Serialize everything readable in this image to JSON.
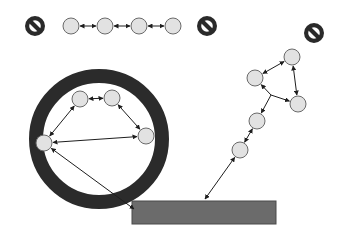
{
  "diagram": {
    "type": "network-topology",
    "colors": {
      "background": "#ffffff",
      "node_fill": "#e2e2e2",
      "node_stroke": "#6a6a6a",
      "edge": "#1e1e1e",
      "ring": "#2b2b2b",
      "bar_fill": "#6b6b6b",
      "prohibited_icon": "#2a2a2a"
    },
    "prohibited_icons": [
      {
        "id": "no-sign-top-left",
        "icon": "prohibited-icon",
        "x": 35,
        "y": 26,
        "r": 10
      },
      {
        "id": "no-sign-top-middle",
        "icon": "prohibited-icon",
        "x": 207,
        "y": 26,
        "r": 10
      },
      {
        "id": "no-sign-top-right",
        "icon": "prohibited-icon",
        "x": 314,
        "y": 33,
        "r": 10
      }
    ],
    "chain_group": {
      "label": "isolated chain",
      "nodes": [
        {
          "id": "c1",
          "x": 71,
          "y": 26,
          "r": 8
        },
        {
          "id": "c2",
          "x": 105,
          "y": 26,
          "r": 8
        },
        {
          "id": "c3",
          "x": 139,
          "y": 26,
          "r": 8
        },
        {
          "id": "c4",
          "x": 173,
          "y": 26,
          "r": 8
        }
      ],
      "edges": [
        {
          "from": "c1",
          "to": "c2",
          "arrows": "both"
        },
        {
          "from": "c2",
          "to": "c3",
          "arrows": "both"
        },
        {
          "from": "c3",
          "to": "c4",
          "arrows": "both"
        }
      ]
    },
    "ring_group": {
      "label": "enclosed cluster",
      "ring": {
        "cx": 99,
        "cy": 139,
        "r": 63,
        "thickness": 14
      },
      "nodes": [
        {
          "id": "r1",
          "x": 80,
          "y": 99,
          "r": 8
        },
        {
          "id": "r2",
          "x": 112,
          "y": 98,
          "r": 8
        },
        {
          "id": "r3",
          "x": 146,
          "y": 136,
          "r": 8
        },
        {
          "id": "r4",
          "x": 44,
          "y": 143,
          "r": 8
        }
      ],
      "edges": [
        {
          "from": "r1",
          "to": "r2",
          "arrows": "both"
        },
        {
          "from": "r1",
          "to": "r4",
          "arrows": "both"
        },
        {
          "from": "r2",
          "to": "r3",
          "arrows": "both"
        },
        {
          "from": "r4",
          "to": "r3",
          "arrows": "both"
        }
      ]
    },
    "tree_group": {
      "label": "connected branch",
      "nodes": [
        {
          "id": "t1",
          "x": 292,
          "y": 57,
          "r": 8
        },
        {
          "id": "t2",
          "x": 255,
          "y": 78,
          "r": 8
        },
        {
          "id": "t3",
          "x": 298,
          "y": 104,
          "r": 8
        },
        {
          "id": "t4",
          "x": 257,
          "y": 121,
          "r": 8
        },
        {
          "id": "t5",
          "x": 240,
          "y": 150,
          "r": 8
        }
      ],
      "branch_point": {
        "x": 271,
        "y": 95
      },
      "edges": [
        {
          "from": "t1",
          "to": "t2",
          "arrows": "both"
        },
        {
          "from": "t1",
          "to": "t3",
          "arrows": "both"
        },
        {
          "from": "branch",
          "to": "t2",
          "arrows": "end"
        },
        {
          "from": "branch",
          "to": "t3",
          "arrows": "end"
        },
        {
          "from": "branch",
          "to": "t4",
          "arrows": "end"
        },
        {
          "from": "t4",
          "to": "t5",
          "arrows": "both"
        }
      ]
    },
    "bar": {
      "label": "shared base",
      "x": 132,
      "y": 201,
      "width": 144,
      "height": 23
    },
    "bar_links": [
      {
        "from": "r4",
        "to_x": 134,
        "to_y": 209,
        "arrows": "both"
      },
      {
        "from": "t5",
        "to_x": 205,
        "to_y": 199,
        "arrows": "both"
      }
    ]
  }
}
